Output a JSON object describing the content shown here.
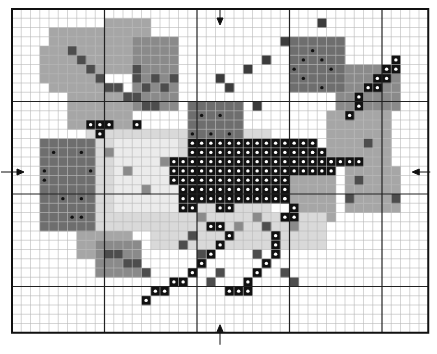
{
  "pattern": {
    "title": "Cross-stitch chart: bird with berries and leaves",
    "grid": {
      "cols": 45,
      "rows": 35,
      "origin_x": 12,
      "origin_y": 9,
      "cell": 9.25,
      "major_every": 10
    },
    "colors": {
      "background": "#ffffff",
      "minor_line": "#b8b8b8",
      "major_line": "#222222",
      "border": "#111111",
      "leaf_light": "#a6a6a6",
      "leaf_mid": "#8a8a8a",
      "leaf_dark": "#4d4d4d",
      "berry": "#6e6e6e",
      "berry_dark": "#3c3c3c",
      "body_light": "#d9d9d9",
      "body_pale": "#ebebeb",
      "black": "#111111",
      "dot_white": "#ffffff",
      "dot_black": "#111111"
    },
    "center_markers": [
      {
        "name": "top-center-arrow",
        "direction": "down"
      },
      {
        "name": "bottom-center-arrow",
        "direction": "up"
      },
      {
        "name": "left-center-arrow",
        "direction": "right"
      },
      {
        "name": "right-center-arrow",
        "direction": "left"
      }
    ]
  }
}
